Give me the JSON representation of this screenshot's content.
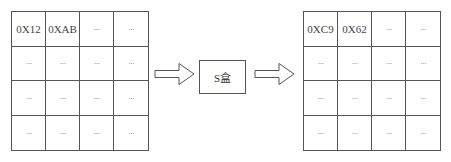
{
  "input_state": {
    "cells": [
      "0X12",
      "0XAB",
      "···",
      "···",
      "···",
      "···",
      "···",
      "···",
      "···",
      "···",
      "···",
      "···",
      "···",
      "···",
      "···",
      "···"
    ]
  },
  "sbox": {
    "label": "S盒"
  },
  "output_state": {
    "cells": [
      "0XC9",
      "0X62",
      "···",
      "···",
      "···",
      "···",
      "···",
      "···",
      "···",
      "···",
      "···",
      "···",
      "···",
      "···",
      "···",
      "···"
    ]
  },
  "arrows": [
    {
      "from": "input_state",
      "to": "sbox",
      "icon": "hollow-right-arrow-icon"
    },
    {
      "from": "sbox",
      "to": "output_state",
      "icon": "hollow-right-arrow-icon"
    }
  ]
}
